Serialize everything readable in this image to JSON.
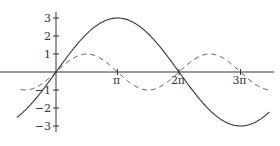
{
  "chart_data": {
    "type": "line",
    "title": "",
    "xlabel": "",
    "ylabel": "",
    "x_ticks": [
      {
        "label": "π",
        "value": 3.14159
      },
      {
        "label": "2π",
        "value": 6.28319
      },
      {
        "label": "3π",
        "value": 9.42478
      }
    ],
    "y_ticks": [
      {
        "label": "3",
        "value": 3
      },
      {
        "label": "2",
        "value": 2
      },
      {
        "label": "1",
        "value": 1
      },
      {
        "label": "−1",
        "value": -1
      },
      {
        "label": "−2",
        "value": -2
      },
      {
        "label": "−3",
        "value": -3
      }
    ],
    "xlim": [
      -2.1,
      11.0
    ],
    "ylim": [
      -3.3,
      3.3
    ],
    "grid": false,
    "legend": null,
    "series": [
      {
        "name": "y = 3 sin(x/2)",
        "style": "solid",
        "expression": "3*sin(x/2)",
        "x_range": [
          -2.0,
          10.9
        ],
        "points": [
          [
            -2.0,
            -2.52
          ],
          [
            0,
            0
          ],
          [
            1.5708,
            2.12
          ],
          [
            3.1416,
            3
          ],
          [
            4.7124,
            2.12
          ],
          [
            6.2832,
            0
          ],
          [
            7.854,
            -2.12
          ],
          [
            9.4248,
            -3
          ],
          [
            10.9,
            -2.2
          ]
        ]
      },
      {
        "name": "y = sin(x)",
        "style": "dashed",
        "expression": "sin(x)",
        "x_range": [
          -1.8,
          10.9
        ],
        "points": [
          [
            -1.5708,
            -1
          ],
          [
            0,
            0
          ],
          [
            1.5708,
            1
          ],
          [
            3.1416,
            0
          ],
          [
            4.7124,
            -1
          ],
          [
            6.2832,
            0
          ],
          [
            7.854,
            1
          ],
          [
            9.4248,
            0
          ],
          [
            10.9,
            -1
          ]
        ]
      }
    ],
    "colors": {
      "axis": "#333333",
      "solid": "#333333",
      "dashed": "#444444"
    }
  }
}
